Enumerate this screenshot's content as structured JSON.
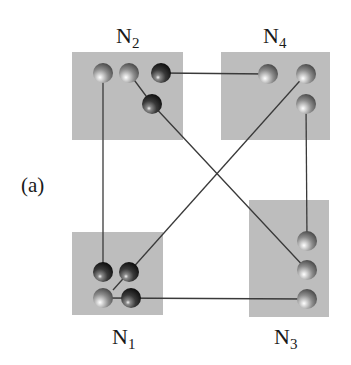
{
  "panel_label": "(a)",
  "colors": {
    "box_fill": "#bdbdbd",
    "link": "#3a3a3a",
    "ball_light": "#9a9a9a",
    "ball_dark": "#262626"
  },
  "nodes": [
    {
      "id": "N1",
      "base": "N",
      "sub": "1",
      "box": {
        "x": 72,
        "y": 232,
        "w": 91,
        "h": 83
      },
      "label_pos": {
        "x": 112,
        "y": 326
      },
      "ports": [
        {
          "id": "n1p1",
          "x": 103,
          "y": 272,
          "shade": "dark"
        },
        {
          "id": "n1p2",
          "x": 129,
          "y": 272,
          "shade": "dark"
        },
        {
          "id": "n1p3",
          "x": 103,
          "y": 298,
          "shade": "light"
        },
        {
          "id": "n1p4",
          "x": 131,
          "y": 298,
          "shade": "dark"
        }
      ]
    },
    {
      "id": "N2",
      "base": "N",
      "sub": "2",
      "box": {
        "x": 72,
        "y": 52,
        "w": 111,
        "h": 88
      },
      "label_pos": {
        "x": 116,
        "y": 25
      },
      "ports": [
        {
          "id": "n2p1",
          "x": 103,
          "y": 73,
          "shade": "light"
        },
        {
          "id": "n2p2",
          "x": 129,
          "y": 73,
          "shade": "light"
        },
        {
          "id": "n2p3",
          "x": 161,
          "y": 73,
          "shade": "dark"
        },
        {
          "id": "n2p4",
          "x": 152,
          "y": 104,
          "shade": "dark"
        }
      ]
    },
    {
      "id": "N3",
      "base": "N",
      "sub": "3",
      "box": {
        "x": 249,
        "y": 200,
        "w": 80,
        "h": 117
      },
      "label_pos": {
        "x": 274,
        "y": 326
      },
      "ports": [
        {
          "id": "n3p1",
          "x": 307,
          "y": 241,
          "shade": "light"
        },
        {
          "id": "n3p2",
          "x": 307,
          "y": 270,
          "shade": "light"
        },
        {
          "id": "n3p3",
          "x": 307,
          "y": 299,
          "shade": "light"
        }
      ]
    },
    {
      "id": "N4",
      "base": "N",
      "sub": "4",
      "box": {
        "x": 221,
        "y": 52,
        "w": 109,
        "h": 88
      },
      "label_pos": {
        "x": 263,
        "y": 25
      },
      "ports": [
        {
          "id": "n4p1",
          "x": 268,
          "y": 74,
          "shade": "light"
        },
        {
          "id": "n4p2",
          "x": 306,
          "y": 74,
          "shade": "light"
        },
        {
          "id": "n4p3",
          "x": 306,
          "y": 104,
          "shade": "light"
        }
      ]
    }
  ],
  "links": [
    {
      "from": "N2",
      "to": "N1",
      "points": [
        [
          103,
          73
        ],
        [
          103,
          272
        ]
      ]
    },
    {
      "from": "N2",
      "to": "N4",
      "points": [
        [
          161,
          73
        ],
        [
          268,
          74
        ]
      ]
    },
    {
      "from": "N2",
      "to": "N3",
      "points": [
        [
          129,
          73
        ],
        [
          152,
          104
        ],
        [
          307,
          270
        ]
      ]
    },
    {
      "from": "N4",
      "to": "N1",
      "points": [
        [
          306,
          74
        ],
        [
          113,
          290
        ]
      ]
    },
    {
      "from": "N4",
      "to": "N3",
      "points": [
        [
          306,
          104
        ],
        [
          307,
          241
        ]
      ]
    },
    {
      "from": "N1",
      "to": "N3",
      "points": [
        [
          103,
          298
        ],
        [
          307,
          299
        ]
      ]
    }
  ]
}
